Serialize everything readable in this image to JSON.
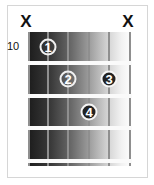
{
  "diagram": {
    "type": "guitar-chord-diagram",
    "start_fret": "10",
    "muted_strings": [
      {
        "string": 6,
        "label": "X",
        "x": 26
      },
      {
        "string": 1,
        "label": "X",
        "x": 128
      }
    ],
    "strings_x": [
      28,
      48,
      68,
      89,
      109,
      130
    ],
    "frets_y": [
      31,
      63,
      96,
      128,
      161
    ],
    "fingers": [
      {
        "finger": "1",
        "string": 5,
        "fret": 1,
        "x": 48,
        "y": 47,
        "style": "outline"
      },
      {
        "finger": "2",
        "string": 4,
        "fret": 2,
        "x": 68,
        "y": 79,
        "style": "outline"
      },
      {
        "finger": "3",
        "string": 2,
        "fret": 2,
        "x": 109,
        "y": 79,
        "style": "filled"
      },
      {
        "finger": "4",
        "string": 3,
        "fret": 3,
        "x": 89,
        "y": 112,
        "style": "filled"
      }
    ]
  }
}
